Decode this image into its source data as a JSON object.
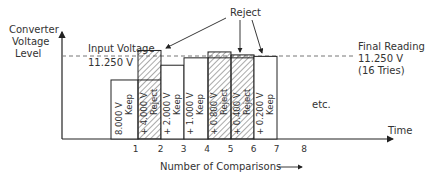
{
  "axes": {
    "y_label_lines": [
      "Converter",
      "Voltage",
      "Level"
    ],
    "x_label": "Time",
    "x_caption": "Number of Comparisons"
  },
  "input_voltage": {
    "label": "Input Voltage",
    "value": "11.250 V"
  },
  "final_reading": {
    "lines": [
      "Final Reading",
      "11.250 V",
      "(16  Tries)"
    ]
  },
  "reject_callout": "Reject",
  "etc_label": "etc.",
  "colors": {
    "ink": "#222222",
    "hatch": "#555555",
    "dashed": "#777777"
  },
  "comparisons": [
    {
      "index": "1",
      "step": "8.000 V",
      "decision": "Keep",
      "cumulative_v": 8.0
    },
    {
      "index": "2",
      "step": "+ 4.000 V",
      "decision": "Reject",
      "cumulative_v": 12.0
    },
    {
      "index": "3",
      "step": "+ 2.000 V",
      "decision": "Keep",
      "cumulative_v": 10.0
    },
    {
      "index": "4",
      "step": "+ 1.000 V",
      "decision": "Keep",
      "cumulative_v": 11.0
    },
    {
      "index": "5",
      "step": "+ 0.800 V",
      "decision": "Reject",
      "cumulative_v": 11.8
    },
    {
      "index": "6",
      "step": "+ 0.400 V",
      "decision": "Reject",
      "cumulative_v": 11.4
    },
    {
      "index": "7",
      "step": "+ 0.200 V",
      "decision": "Keep",
      "cumulative_v": 11.2
    }
  ],
  "next_index": "8"
}
